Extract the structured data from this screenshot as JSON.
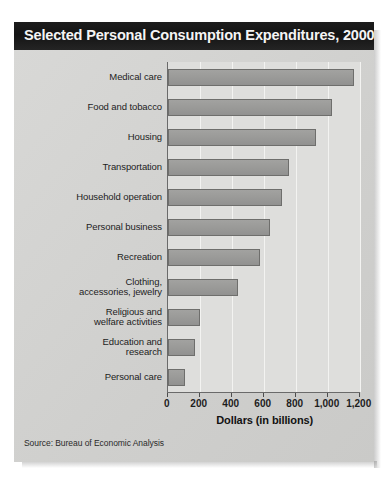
{
  "figure": {
    "title": "Selected Personal Consumption Expenditures, 2000",
    "source": "Source: Bureau of Economic Analysis",
    "colors": {
      "title_bar": "#1a1a1a",
      "title_text": "#f4f4f4",
      "panel_background": "#d4d4d2",
      "plot_background": "#dededc",
      "bar_fill": "#9a9a98",
      "bar_border": "#6e6e6c",
      "gridline": "#f3f3f1",
      "axis_line": "#6a6a6a"
    }
  },
  "chart_data": {
    "type": "bar",
    "orientation": "horizontal",
    "title": "Selected Personal Consumption Expenditures, 2000",
    "xlabel": "Dollars (in billions)",
    "ylabel": "",
    "xlim": [
      0,
      1200
    ],
    "ylim": null,
    "grid": "vertical gridlines at each x tick",
    "legend": "none",
    "xticks": [
      0,
      200,
      400,
      600,
      800,
      1000,
      1200
    ],
    "xtick_labels": [
      "0",
      "200",
      "400",
      "600",
      "800",
      "1,000",
      "1,200"
    ],
    "categories": [
      "Medical care",
      "Food and tobacco",
      "Housing",
      "Transportation",
      "Household operation",
      "Personal business",
      "Recreation",
      "Clothing, accessories, jewelry",
      "Religious and welfare activities",
      "Education and research",
      "Personal care"
    ],
    "category_label_lines": [
      [
        "Medical care"
      ],
      [
        "Food and tobacco"
      ],
      [
        "Housing"
      ],
      [
        "Transportation"
      ],
      [
        "Household operation"
      ],
      [
        "Personal business"
      ],
      [
        "Recreation"
      ],
      [
        "Clothing,",
        "accessories, jewelry"
      ],
      [
        "Religious and",
        "welfare activities"
      ],
      [
        "Education and",
        "research"
      ],
      [
        "Personal care"
      ]
    ],
    "values": [
      1165,
      1025,
      925,
      760,
      715,
      640,
      580,
      440,
      200,
      170,
      110
    ],
    "units": "billions of dollars",
    "annotations": [],
    "source": "Source: Bureau of Economic Analysis"
  }
}
